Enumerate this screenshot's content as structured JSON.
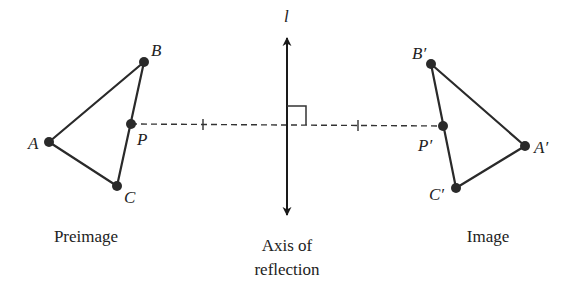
{
  "diagram": {
    "colors": {
      "stroke": "#2a2a2a",
      "background": "#ffffff",
      "text": "#222222"
    },
    "preimage": {
      "caption": "Preimage",
      "points": {
        "A": {
          "label": "A",
          "x": 49,
          "y": 142
        },
        "B": {
          "label": "B",
          "x": 144,
          "y": 62
        },
        "C": {
          "label": "C",
          "x": 117,
          "y": 186
        },
        "P": {
          "label": "P",
          "x": 131,
          "y": 124
        }
      }
    },
    "image": {
      "caption": "Image",
      "points": {
        "A": {
          "label": "A′",
          "x": 525,
          "y": 146
        },
        "B": {
          "label": "B′",
          "x": 431,
          "y": 64
        },
        "C": {
          "label": "C′",
          "x": 456,
          "y": 188
        },
        "P": {
          "label": "P′",
          "x": 443,
          "y": 126
        }
      }
    },
    "axis": {
      "label": "l",
      "caption_line1": "Axis of",
      "caption_line2": "reflection",
      "x": 287,
      "y_top": 38,
      "y_bottom": 215
    },
    "connector": {
      "style": "dashed",
      "from": "P",
      "to": "P′",
      "tick_marks": 2,
      "right_angle_marker": true
    }
  }
}
